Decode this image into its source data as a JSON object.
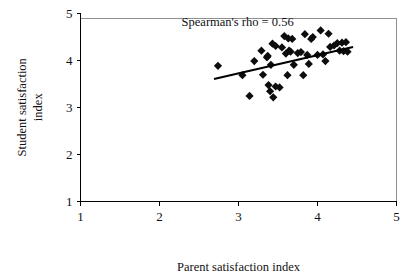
{
  "chart_data": {
    "type": "scatter",
    "title": "",
    "xlabel": "Parent satisfaction index",
    "ylabel": "Student satisfaction index",
    "ylabel_line1": "Student satisfaction",
    "ylabel_line2": "index",
    "xlim": [
      1,
      5
    ],
    "ylim": [
      1,
      5
    ],
    "xticks": [
      1,
      2,
      3,
      4,
      5
    ],
    "yticks": [
      1,
      2,
      3,
      4,
      5
    ],
    "xtick_labels": [
      "1",
      "2",
      "3",
      "4",
      "5"
    ],
    "ytick_labels": [
      "1",
      "2",
      "3",
      "4",
      "5"
    ],
    "grid": false,
    "legend": "none",
    "marker_shape": "diamond",
    "marker_color": "#0d0d0d",
    "annotations": [
      {
        "name": "spearman-rho",
        "text": "Spearman's rho = 0.56",
        "x": 2.28,
        "y": 4.72
      }
    ],
    "trendline": {
      "type": "linear-fit",
      "color": "#000000",
      "x_start": 2.69,
      "y_start": 3.6,
      "x_end": 4.45,
      "y_end": 4.28
    },
    "points": [
      {
        "x": 2.74,
        "y": 3.88
      },
      {
        "x": 3.05,
        "y": 3.68
      },
      {
        "x": 3.14,
        "y": 3.24
      },
      {
        "x": 3.2,
        "y": 3.98
      },
      {
        "x": 3.29,
        "y": 4.2
      },
      {
        "x": 3.31,
        "y": 3.69
      },
      {
        "x": 3.36,
        "y": 4.06
      },
      {
        "x": 3.37,
        "y": 4.09
      },
      {
        "x": 3.38,
        "y": 3.47
      },
      {
        "x": 3.4,
        "y": 3.34
      },
      {
        "x": 3.41,
        "y": 3.9
      },
      {
        "x": 3.43,
        "y": 4.35
      },
      {
        "x": 3.44,
        "y": 3.21
      },
      {
        "x": 3.47,
        "y": 3.44
      },
      {
        "x": 3.47,
        "y": 4.3
      },
      {
        "x": 3.52,
        "y": 3.42
      },
      {
        "x": 3.55,
        "y": 4.27
      },
      {
        "x": 3.58,
        "y": 4.51
      },
      {
        "x": 3.6,
        "y": 4.14
      },
      {
        "x": 3.62,
        "y": 3.68
      },
      {
        "x": 3.63,
        "y": 4.46
      },
      {
        "x": 3.64,
        "y": 4.2
      },
      {
        "x": 3.66,
        "y": 4.18
      },
      {
        "x": 3.68,
        "y": 4.45
      },
      {
        "x": 3.7,
        "y": 3.9
      },
      {
        "x": 3.75,
        "y": 4.15
      },
      {
        "x": 3.79,
        "y": 4.17
      },
      {
        "x": 3.82,
        "y": 3.68
      },
      {
        "x": 3.84,
        "y": 4.55
      },
      {
        "x": 3.87,
        "y": 4.11
      },
      {
        "x": 3.89,
        "y": 3.92
      },
      {
        "x": 3.92,
        "y": 4.45
      },
      {
        "x": 3.94,
        "y": 4.49
      },
      {
        "x": 4.0,
        "y": 4.11
      },
      {
        "x": 4.04,
        "y": 4.63
      },
      {
        "x": 4.07,
        "y": 4.12
      },
      {
        "x": 4.1,
        "y": 3.98
      },
      {
        "x": 4.14,
        "y": 4.56
      },
      {
        "x": 4.16,
        "y": 4.28
      },
      {
        "x": 4.21,
        "y": 4.31
      },
      {
        "x": 4.25,
        "y": 4.36
      },
      {
        "x": 4.28,
        "y": 4.2
      },
      {
        "x": 4.31,
        "y": 4.37
      },
      {
        "x": 4.33,
        "y": 4.19
      },
      {
        "x": 4.36,
        "y": 4.38
      },
      {
        "x": 4.38,
        "y": 4.18
      }
    ]
  }
}
